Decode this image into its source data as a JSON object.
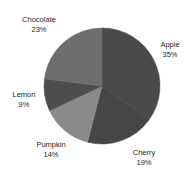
{
  "chart_data": {
    "type": "pie",
    "title": "",
    "categories": [
      "Apple",
      "Cherry",
      "Pumpkin",
      "Lemon",
      "Chocolate"
    ],
    "values": [
      35,
      19,
      14,
      9,
      23
    ],
    "unit": "%",
    "total": 100,
    "start_angle_deg": 0,
    "direction": "clockwise",
    "legend": "none",
    "labels_position": "outside",
    "grid": false,
    "xlabel": "",
    "ylabel": "",
    "slices": [
      {
        "name": "Apple",
        "value": 35,
        "label": "Apple",
        "value_label": "35%",
        "color": "#4a4a4a",
        "start_deg": 0.0,
        "end_deg": 126.0
      },
      {
        "name": "Cherry",
        "value": 19,
        "label": "Cherry",
        "value_label": "19%",
        "color": "#464646",
        "start_deg": 126.0,
        "end_deg": 194.4
      },
      {
        "name": "Pumpkin",
        "value": 14,
        "label": "Pumpkin",
        "value_label": "14%",
        "color": "#8a8a8a",
        "start_deg": 194.4,
        "end_deg": 244.8
      },
      {
        "name": "Lemon",
        "value": 9,
        "label": "Lemon",
        "value_label": "9%",
        "color": "#4d4d4d",
        "start_deg": 244.8,
        "end_deg": 277.2
      },
      {
        "name": "Chocolate",
        "value": 23,
        "label": "Chocolate",
        "value_label": "23%",
        "color": "#6e6e6e",
        "start_deg": 277.2,
        "end_deg": 360.0
      }
    ],
    "geometry": {
      "cx": 102,
      "cy": 86,
      "r": 58
    },
    "background_color": "#ffffff"
  }
}
